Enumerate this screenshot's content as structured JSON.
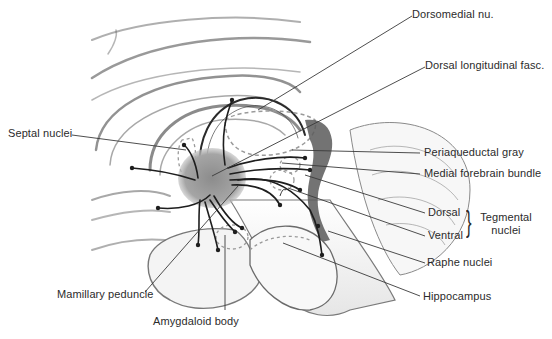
{
  "figure": {
    "colors": {
      "background": "#ffffff",
      "brain_fill": "#f4f4f4",
      "brain_shadow": "#8a8a8a",
      "hypothalamus_fill": "#8f8f8f",
      "ventricle_fill": "#5a5a5a",
      "fiber": "#1e1e1e",
      "dashed_outline": "#9a9a9a",
      "leader_line": "#3a3a3a",
      "label_text": "#2b2b2b"
    }
  },
  "labels": {
    "dorsomedial": "Dorsomedial nu.",
    "dorsal_longitudinal": "Dorsal longitudinal fasc.",
    "septal": "Septal nuclei",
    "periaqueductal": "Periaqueductal gray",
    "medial_forebrain": "Medial forebrain bundle",
    "dorsal": "Dorsal",
    "ventral": "Ventral",
    "tegmental_line1": "Tegmental",
    "tegmental_line2": "nuclei",
    "raphe": "Raphe nuclei",
    "hippocampus": "Hippocampus",
    "mamillary": "Mamillary peduncle",
    "amygdaloid": "Amygdaloid body"
  },
  "glyphs": {
    "brace": "}"
  }
}
